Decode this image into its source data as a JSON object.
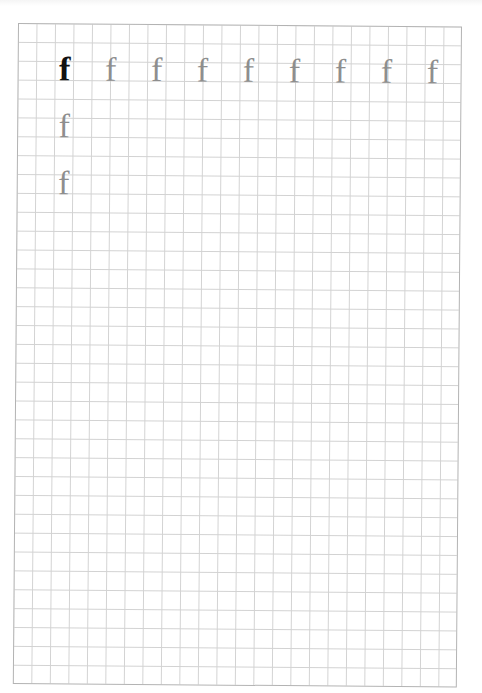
{
  "worksheet": {
    "letter": "f",
    "grid": {
      "columns": 24,
      "rows": 35,
      "line_color": "#d2d2d2",
      "border_color": "#b3b3b3"
    },
    "colors": {
      "model_letter": "#111111",
      "trace_letter": "#8e8e8e"
    },
    "glyphs": [
      {
        "char": "f",
        "style": "model",
        "x": 47,
        "y": 46
      },
      {
        "char": "f",
        "style": "trace",
        "x": 93,
        "y": 46
      },
      {
        "char": "f",
        "style": "trace",
        "x": 139,
        "y": 46
      },
      {
        "char": "f",
        "style": "trace",
        "x": 185,
        "y": 46
      },
      {
        "char": "f",
        "style": "trace",
        "x": 231,
        "y": 46
      },
      {
        "char": "f",
        "style": "trace",
        "x": 277,
        "y": 46
      },
      {
        "char": "f",
        "style": "trace",
        "x": 323,
        "y": 46
      },
      {
        "char": "f",
        "style": "trace",
        "x": 369,
        "y": 46
      },
      {
        "char": "f",
        "style": "trace",
        "x": 415,
        "y": 46
      },
      {
        "char": "f",
        "style": "trace",
        "x": 47,
        "y": 103
      },
      {
        "char": "f",
        "style": "trace",
        "x": 47,
        "y": 160
      }
    ]
  }
}
